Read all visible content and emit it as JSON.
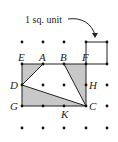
{
  "annotation": {
    "text": "1 sq. unit"
  },
  "grid": {
    "cols_x": [
      22,
      43,
      64,
      86,
      107
    ],
    "rows_y": [
      42,
      64,
      85,
      106,
      128
    ],
    "dot_color": "#111111"
  },
  "points": {
    "E": {
      "label": "E",
      "col": 0,
      "row": 1
    },
    "A": {
      "label": "A",
      "col": 1,
      "row": 1
    },
    "B": {
      "label": "B",
      "col": 2,
      "row": 1
    },
    "F": {
      "label": "F",
      "col": 3,
      "row": 1
    },
    "D": {
      "label": "D",
      "col": 0,
      "row": 2
    },
    "H": {
      "label": "H",
      "col": 3,
      "row": 2
    },
    "G": {
      "label": "G",
      "col": 0,
      "row": 3
    },
    "K": {
      "label": "K",
      "col": 2,
      "row": 3
    },
    "C": {
      "label": "C",
      "col": 3,
      "row": 3
    }
  },
  "shaded_regions": [
    {
      "name": "triangle-EAD",
      "vertices": [
        "E",
        "A",
        "D"
      ]
    },
    {
      "name": "triangle-BFC",
      "vertices": [
        "B",
        "F",
        "C"
      ]
    },
    {
      "name": "triangle-DCG",
      "vertices": [
        "D",
        "C",
        "G"
      ]
    }
  ],
  "colors": {
    "shade": "#c8c8c8",
    "line": "#222222"
  }
}
